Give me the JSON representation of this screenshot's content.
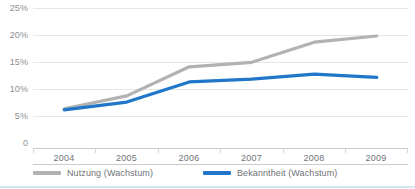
{
  "chart_data": {
    "type": "line",
    "title": "",
    "xlabel": "",
    "ylabel": "",
    "categories": [
      "2004",
      "2005",
      "2006",
      "2007",
      "2008",
      "2009"
    ],
    "x": [
      2004,
      2005,
      2006,
      2007,
      2008,
      2009
    ],
    "ylim": [
      0,
      25
    ],
    "ytick_labels": [
      "25%",
      "20%",
      "15%",
      "10%",
      "5%",
      "0"
    ],
    "ytick_values": [
      25,
      20,
      15,
      10,
      5,
      0
    ],
    "grid": true,
    "legend_position": "bottom",
    "series": [
      {
        "name": "Nutzung (Wachstum)",
        "color": "#b2b2b2",
        "values": [
          7.0,
          9.3,
          14.5,
          15.3,
          18.9,
          20.0
        ]
      },
      {
        "name": "Bekanntheit (Wachstum)",
        "color": "#2077c9",
        "values": [
          6.8,
          8.2,
          11.8,
          12.3,
          13.2,
          12.6
        ]
      }
    ]
  },
  "axes": {
    "y_labels": [
      "25%",
      "20%",
      "15%",
      "10%",
      "5%",
      "0"
    ],
    "x_labels": [
      "2004",
      "2005",
      "2006",
      "2007",
      "2008",
      "2009"
    ]
  },
  "legend": {
    "items": [
      {
        "label": "Nutzung (Wachstum)",
        "color": "#b2b2b2"
      },
      {
        "label": "Bekanntheit (Wachstum)",
        "color": "#2077c9"
      }
    ]
  },
  "colors": {
    "series_gray": "#b2b2b2",
    "series_blue": "#2077c9",
    "gridline": "#e4e6e8",
    "axis": "#c9ccce",
    "tick_text": "#6f7276",
    "ytick_text": "#8d8f92",
    "bottom_rule": "#d6e3ee",
    "background": "#ffffff"
  }
}
